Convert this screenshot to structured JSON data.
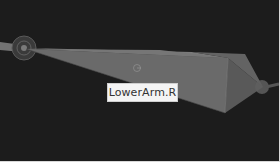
{
  "viewport": {
    "background": "#1c1c1c",
    "bones": [
      {
        "name": "UpperArm.R",
        "label": "",
        "selected": false
      },
      {
        "name": "LowerArm.R",
        "label": "",
        "selected": true
      }
    ],
    "joints": [
      {
        "name": "shoulder-joint"
      },
      {
        "name": "elbow-joint"
      },
      {
        "name": "wrist-joint"
      }
    ]
  },
  "tooltip": {
    "text": "LowerArm.R"
  },
  "colors": {
    "bone_fill": "#6a6a6a",
    "bone_edge": "#8a8a8a",
    "tooltip_bg": "#f4f4f4"
  }
}
